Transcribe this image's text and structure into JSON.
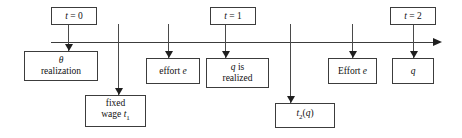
{
  "diagram": {
    "type": "timeline",
    "width": 462,
    "height": 138,
    "colors": {
      "background": "#ffffff",
      "line": "#3c3c3c",
      "box_border": "#3c3c3c",
      "text": "#111111",
      "arrowhead": "#1f1f1f"
    },
    "axis": {
      "name": "time-axis",
      "direction": "left-to-right",
      "has_arrowhead": true,
      "x_start": 51,
      "x_end": 440,
      "y": 42,
      "tick_positions": [
        68,
        118,
        168,
        225,
        290,
        352,
        413
      ]
    },
    "time_labels": [
      {
        "name": "t0",
        "text": "t = 0",
        "x": 51,
        "y": 7,
        "w": 46,
        "h": 18
      },
      {
        "name": "t1",
        "text": "t = 1",
        "x": 210,
        "y": 7,
        "w": 46,
        "h": 18
      },
      {
        "name": "t2",
        "text": "t = 2",
        "x": 390,
        "y": 7,
        "w": 46,
        "h": 18
      }
    ],
    "event_boxes": [
      {
        "name": "theta-realization",
        "line1": "θ",
        "line2": "realization",
        "x": 24,
        "y": 51,
        "w": 74,
        "h": 30,
        "tick_x": 68,
        "arrow_from_y": 42,
        "arrow_to_y": 51,
        "position": "below-axis"
      },
      {
        "name": "fixed-wage",
        "line1": "fixed",
        "line2": "wage t₁",
        "x": 85,
        "y": 95,
        "w": 61,
        "h": 32,
        "tick_x": 118,
        "arrow_from_y": 42,
        "arrow_to_y": 95,
        "position": "below-axis-low"
      },
      {
        "name": "effort-lowercase",
        "line1": "effort e",
        "line2": "",
        "x": 146,
        "y": 58,
        "w": 54,
        "h": 26,
        "tick_x": 168,
        "arrow_from_y": 42,
        "arrow_to_y": 58,
        "position": "below-axis"
      },
      {
        "name": "q-is-realized",
        "line1": "q is",
        "line2": "realized",
        "x": 206,
        "y": 58,
        "w": 63,
        "h": 30,
        "tick_x": 225,
        "arrow_from_y": 42,
        "arrow_to_y": 58,
        "position": "below-axis"
      },
      {
        "name": "transfer-t2-of-q",
        "line1": "t₂(q)",
        "line2": "",
        "x": 275,
        "y": 103,
        "w": 60,
        "h": 25,
        "tick_x": 290,
        "arrow_from_y": 42,
        "arrow_to_y": 103,
        "position": "below-axis-low"
      },
      {
        "name": "effort-uppercase",
        "line1": "Effort e",
        "line2": "",
        "x": 328,
        "y": 58,
        "w": 49,
        "h": 26,
        "tick_x": 352,
        "arrow_from_y": 42,
        "arrow_to_y": 58,
        "position": "below-axis"
      },
      {
        "name": "output-q",
        "line1": "q",
        "line2": "",
        "x": 392,
        "y": 58,
        "w": 42,
        "h": 26,
        "tick_x": 413,
        "arrow_from_y": 42,
        "arrow_to_y": 58,
        "position": "below-axis"
      }
    ],
    "time_label_connectors": [
      {
        "name": "t0-connector",
        "x": 68,
        "from_y": 25,
        "to_y": 42
      },
      {
        "name": "t1-connector",
        "x": 225,
        "from_y": 25,
        "to_y": 42
      },
      {
        "name": "t2-connector",
        "x": 413,
        "from_y": 25,
        "to_y": 42
      }
    ]
  }
}
